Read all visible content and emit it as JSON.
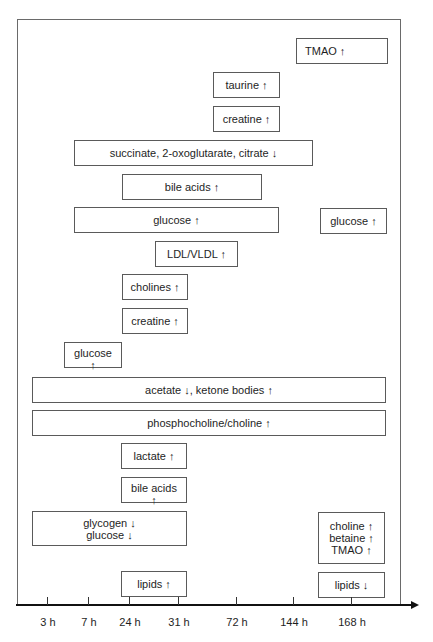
{
  "diagram": {
    "type": "timeline",
    "axis": {
      "ticks": [
        {
          "label": "3 h",
          "x": 47
        },
        {
          "label": "7 h",
          "x": 88
        },
        {
          "label": "24 h",
          "x": 129
        },
        {
          "label": "31 h",
          "x": 178
        },
        {
          "label": "72 h",
          "x": 236
        },
        {
          "label": "144 h",
          "x": 293
        },
        {
          "label": "168 h",
          "x": 351
        }
      ]
    },
    "boxes": [
      {
        "id": "tmao-1",
        "text": "TMAO ↑",
        "x": 296,
        "y": 38,
        "w": 92,
        "h": 26,
        "align": "left"
      },
      {
        "id": "taurine",
        "text": "taurine ↑",
        "x": 213,
        "y": 72,
        "w": 67,
        "h": 26
      },
      {
        "id": "creatine-1",
        "text": "creatine ↑",
        "x": 213,
        "y": 106,
        "w": 67,
        "h": 26
      },
      {
        "id": "succinate",
        "text": "succinate, 2-oxoglutarate, citrate ↓",
        "x": 74,
        "y": 140,
        "w": 239,
        "h": 26
      },
      {
        "id": "bile-acids-1",
        "text": "bile acids ↑",
        "x": 122,
        "y": 174,
        "w": 140,
        "h": 26
      },
      {
        "id": "glucose-1",
        "text": "glucose ↑",
        "x": 74,
        "y": 207,
        "w": 205,
        "h": 26
      },
      {
        "id": "glucose-2",
        "text": "glucose ↑",
        "x": 320,
        "y": 208,
        "w": 67,
        "h": 26
      },
      {
        "id": "ldl-vldl",
        "text": "LDL/VLDL ↑",
        "x": 155,
        "y": 241,
        "w": 83,
        "h": 26
      },
      {
        "id": "cholines",
        "text": "cholines ↑",
        "x": 122,
        "y": 274,
        "w": 66,
        "h": 26
      },
      {
        "id": "creatine-2",
        "text": "creatine ↑",
        "x": 122,
        "y": 308,
        "w": 66,
        "h": 26
      },
      {
        "id": "glucose-3",
        "text": "glucose\n↑",
        "x": 64,
        "y": 342,
        "w": 58,
        "h": 26,
        "align": "top"
      },
      {
        "id": "acetate",
        "text": "acetate ↓, ketone bodies ↑",
        "x": 32,
        "y": 377,
        "w": 354,
        "h": 26
      },
      {
        "id": "phosphocholine",
        "text": "phosphocholine/choline ↑",
        "x": 32,
        "y": 410,
        "w": 354,
        "h": 26
      },
      {
        "id": "lactate",
        "text": "lactate ↑",
        "x": 121,
        "y": 443,
        "w": 66,
        "h": 26
      },
      {
        "id": "bile-acids-2",
        "text": "bile acids\n↑",
        "x": 121,
        "y": 477,
        "w": 66,
        "h": 26,
        "align": "top"
      },
      {
        "id": "glycogen-glucose",
        "text": "glycogen ↓\nglucose ↓",
        "x": 32,
        "y": 511,
        "w": 155,
        "h": 35
      },
      {
        "id": "choline-betaine-tmao",
        "text": "choline ↑\nbetaine ↑\nTMAO ↑",
        "x": 318,
        "y": 512,
        "w": 67,
        "h": 52
      },
      {
        "id": "lipids-up",
        "text": "lipids ↑",
        "x": 121,
        "y": 571,
        "w": 66,
        "h": 26
      },
      {
        "id": "lipids-down",
        "text": "lipids ↓",
        "x": 318,
        "y": 572,
        "w": 67,
        "h": 26
      }
    ]
  }
}
